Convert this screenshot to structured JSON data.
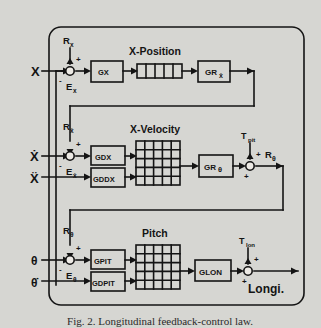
{
  "figure": {
    "caption": "Fig. 2.  Longitudinal feedback-control law.",
    "background_color": "#d6d6d2",
    "line_color": "#141414"
  },
  "channels": [
    {
      "id": "x-position",
      "title": "X-Position",
      "input_label": "X",
      "reference_label": "R",
      "reference_sub": "x",
      "error_label": "E",
      "error_sub": "x",
      "sum_plus": "+",
      "sum_minus": "-",
      "gain_blocks": [
        "GX"
      ],
      "matrix": {
        "rows": 1,
        "cols": 5
      },
      "output_gain": "GR",
      "output_gain_sub": "ẋ"
    },
    {
      "id": "x-velocity",
      "title": "X-Velocity",
      "input_label": "Ẋ",
      "input_label_2": "Ẍ",
      "reference_label": "R",
      "reference_sub": "ẋ",
      "error_label": "E",
      "error_sub": "ẋ",
      "sum_plus": "+",
      "sum_minus": "-",
      "gain_blocks": [
        "GDX",
        "GDDX"
      ],
      "matrix": {
        "rows": 5,
        "cols": 5
      },
      "output_gain": "GR",
      "output_gain_sub": "θ",
      "trim_label": "T",
      "trim_sub": "pit",
      "result_label": "R",
      "result_sub": "θ"
    },
    {
      "id": "pitch",
      "title": "Pitch",
      "input_label": "θ",
      "input_label_2": "θ̇",
      "reference_label": "R",
      "reference_sub": "θ",
      "error_label": "E",
      "error_sub": "θ",
      "sum_plus": "+",
      "sum_minus": "-",
      "gain_blocks": [
        "GPIT",
        "GDPIT"
      ],
      "matrix": {
        "rows": 5,
        "cols": 5
      },
      "output_gain": "GLON",
      "trim_label": "T",
      "trim_sub": "lon",
      "result_label": "Longi."
    }
  ]
}
